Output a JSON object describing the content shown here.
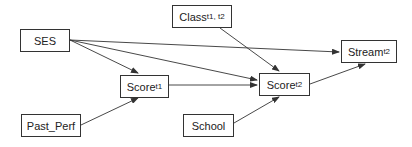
{
  "diagram": {
    "type": "path-diagram",
    "nodes": [
      {
        "id": "ses",
        "label": "SES",
        "sub": "",
        "x": 20,
        "y": 29,
        "w": 50,
        "h": 23
      },
      {
        "id": "class",
        "label": "Class",
        "sub": "t1, t2",
        "x": 172,
        "y": 5,
        "w": 60,
        "h": 23
      },
      {
        "id": "score_t1",
        "label": "Score",
        "sub": "t1",
        "x": 120,
        "y": 75,
        "w": 49,
        "h": 23
      },
      {
        "id": "score_t2",
        "label": "Score",
        "sub": "t2",
        "x": 259,
        "y": 73,
        "w": 51,
        "h": 23
      },
      {
        "id": "stream_t2",
        "label": "Stream",
        "sub": "t2",
        "x": 341,
        "y": 40,
        "w": 56,
        "h": 23
      },
      {
        "id": "past_perf",
        "label": "Past_Perf",
        "sub": "",
        "x": 21,
        "y": 114,
        "w": 60,
        "h": 23
      },
      {
        "id": "school",
        "label": "School",
        "sub": "",
        "x": 183,
        "y": 114,
        "w": 51,
        "h": 23
      }
    ],
    "edges": [
      {
        "from": "ses",
        "to": "score_t1",
        "x1": 70,
        "y1": 40,
        "x2": 138,
        "y2": 73
      },
      {
        "from": "ses",
        "to": "score_t2",
        "x1": 70,
        "y1": 40,
        "x2": 257,
        "y2": 80
      },
      {
        "from": "ses",
        "to": "stream_t2",
        "x1": 70,
        "y1": 40,
        "x2": 339,
        "y2": 52
      },
      {
        "from": "score_t1",
        "to": "score_t2",
        "x1": 169,
        "y1": 85,
        "x2": 257,
        "y2": 85
      },
      {
        "from": "class",
        "to": "score_t2",
        "x1": 220,
        "y1": 28,
        "x2": 279,
        "y2": 71
      },
      {
        "from": "past_perf",
        "to": "score_t1",
        "x1": 81,
        "y1": 125,
        "x2": 138,
        "y2": 98
      },
      {
        "from": "school",
        "to": "score_t2",
        "x1": 234,
        "y1": 123,
        "x2": 279,
        "y2": 97
      },
      {
        "from": "score_t2",
        "to": "stream_t2",
        "x1": 310,
        "y1": 84,
        "x2": 365,
        "y2": 64
      }
    ],
    "line_color": "#333333"
  }
}
